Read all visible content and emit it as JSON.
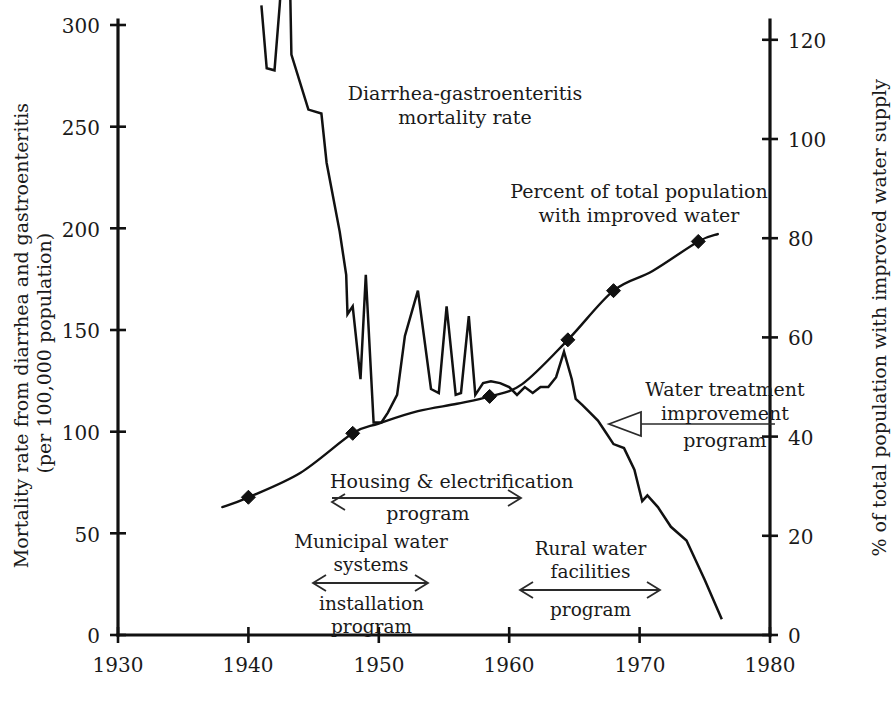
{
  "figure": {
    "background": "#ffffff",
    "ink_color": "#111111",
    "width": 885,
    "height": 710
  },
  "axes": {
    "left": {
      "title_line1": "Mortality rate from diarrhea and gastroenteritis",
      "title_line2": "(per 100,000 population)",
      "ticks": [
        0,
        50,
        100,
        150,
        200,
        250,
        300
      ],
      "min": 0,
      "max": 310
    },
    "right": {
      "title": "% of total population with improved water supply",
      "ticks": [
        0,
        20,
        40,
        60,
        80,
        100,
        120
      ],
      "min": 0,
      "max": 124
    },
    "bottom": {
      "ticks": [
        1930,
        1940,
        1950,
        1960,
        1970,
        1980
      ],
      "min": 1930,
      "max": 1980
    }
  },
  "annotations": {
    "mortality_label": {
      "line1": "Diarrhea-gastroenteritis",
      "line2": "mortality rate"
    },
    "percent_label": {
      "line1": "Percent of total population",
      "line2": "with improved water"
    },
    "water_treatment": {
      "line1": "Water treatment",
      "line2": "improvement",
      "line3": "program"
    },
    "housing": {
      "line1": "Housing & electrification",
      "line2": "program",
      "span_start": 1948,
      "span_end": 1965.5
    },
    "municipal": {
      "line1": "Municipal water",
      "line2": "systems",
      "line3": "installation",
      "line4": "program",
      "span_start": 1945.5,
      "span_end": 1951.5
    },
    "rural": {
      "line1": "Rural water",
      "line2": "facilities",
      "line3": "program",
      "span_start": 1960.5,
      "span_end": 1968.5
    }
  },
  "chart_data": {
    "type": "line",
    "title": "",
    "xlabel": "",
    "ylabel": "Mortality rate from diarrhea and gastroenteritis (per 100,000 population)",
    "ylabel_right": "% of total population with improved water supply",
    "xlim": [
      1930,
      1980
    ],
    "ylim": [
      0,
      310
    ],
    "ylim_right": [
      0,
      124
    ],
    "grid": false,
    "legend": "none (inline annotations)",
    "series": [
      {
        "name": "Diarrhea-gastroenteritis mortality rate",
        "axis": "left",
        "units": "deaths per 100,000 population",
        "marker": "none",
        "x": [
          1941.0,
          1941.4,
          1942.0,
          1942.4,
          1942.5,
          1943.2,
          1943.3,
          1944.6,
          1945.6,
          1946.0,
          1947.0,
          1947.5,
          1947.6,
          1948.0,
          1948.6,
          1949.0,
          1949.6,
          1950.2,
          1950.7,
          1951.4,
          1952.0,
          1953.0,
          1954.0,
          1954.6,
          1955.2,
          1955.9,
          1956.3,
          1956.9,
          1957.4,
          1958.0,
          1958.6,
          1959.3,
          1960.0,
          1960.6,
          1961.2,
          1961.8,
          1962.4,
          1963.0,
          1963.6,
          1964.2,
          1964.8,
          1965.1,
          1965.6,
          1966.2,
          1966.8,
          1967.4,
          1968.0,
          1968.8,
          1969.6,
          1970.2,
          1970.6,
          1971.4,
          1972.4,
          1973.6,
          1975.0,
          1976.3
        ],
        "y": [
          320,
          288,
          287,
          320,
          330,
          330,
          295,
          267,
          265,
          240,
          205,
          183,
          163,
          167,
          130,
          183,
          108,
          108,
          113,
          122,
          152,
          175,
          125,
          123,
          167,
          122,
          123,
          162,
          122,
          128,
          129,
          128,
          126,
          122,
          126,
          123,
          126,
          126,
          131,
          144,
          130,
          120,
          117,
          113,
          109,
          103,
          97,
          95,
          84,
          68,
          71,
          65,
          55,
          48,
          28,
          8
        ]
      },
      {
        "name": "Percent of total population with improved water",
        "axis": "right",
        "units": "percent",
        "marker": "diamond",
        "x": [
          1938.0,
          1940.0,
          1944.0,
          1948.0,
          1950.0,
          1953.0,
          1956.0,
          1958.5,
          1961.0,
          1964.5,
          1968.0,
          1971.0,
          1974.5,
          1976.0
        ],
        "y": [
          26.0,
          28.0,
          33.0,
          41.0,
          43.0,
          45.5,
          47.0,
          48.5,
          51.0,
          60.0,
          70.0,
          74.0,
          80.0,
          81.5
        ],
        "marker_x": [
          1940.0,
          1948.0,
          1958.5,
          1964.5,
          1968.0,
          1974.5
        ],
        "marker_y": [
          28.0,
          41.0,
          48.5,
          60.0,
          70.0,
          80.0
        ]
      }
    ]
  }
}
